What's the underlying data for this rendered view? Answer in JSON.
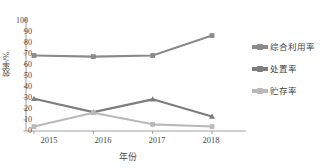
{
  "chart_data": {
    "type": "line",
    "title": "",
    "xlabel": "年份",
    "ylabel": "效率/%",
    "categories": [
      "2015",
      "2016",
      "2017",
      "2018"
    ],
    "x": [
      2015,
      2016,
      2017,
      2018
    ],
    "ylim": [
      0,
      100
    ],
    "ytick_step": 10,
    "yticks": [
      "0",
      "10",
      "20",
      "30",
      "40",
      "50",
      "60",
      "70",
      "80",
      "90",
      "100"
    ],
    "grid": false,
    "legend_position": "right",
    "series": [
      {
        "name": "综合利用率",
        "values": [
          68,
          67,
          68,
          86
        ],
        "color": "#8a8a8a",
        "marker": "square"
      },
      {
        "name": "处置率",
        "values": [
          29,
          17,
          28.5,
          13
        ],
        "color": "#7d7d7d",
        "marker": "triangle"
      },
      {
        "name": "贮存率",
        "values": [
          4,
          16.5,
          6,
          4
        ],
        "color": "#b9b9b9",
        "marker": "square"
      }
    ]
  },
  "axes": {
    "ylabel": "效率/%",
    "xlabel": "年份",
    "ytick_0": "0",
    "ytick_1": "10",
    "ytick_2": "20",
    "ytick_3": "30",
    "ytick_4": "40",
    "ytick_5": "50",
    "ytick_6": "60",
    "ytick_7": "70",
    "ytick_8": "80",
    "ytick_9": "90",
    "ytick_10": "100",
    "xtick_0": "2015",
    "xtick_1": "2016",
    "xtick_2": "2017",
    "xtick_3": "2018"
  },
  "legend": {
    "items": [
      {
        "label": "综合利用率",
        "color": "#8a8a8a"
      },
      {
        "label": "处置率",
        "color": "#7d7d7d"
      },
      {
        "label": "贮存率",
        "color": "#b9b9b9"
      }
    ]
  }
}
